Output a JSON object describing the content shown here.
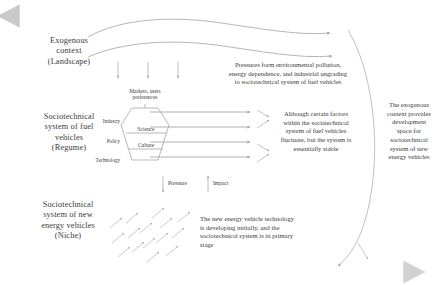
{
  "figure": {
    "type": "multi-level-perspective-diagram",
    "background": "#ffffff",
    "stroke_color": "#8d8d8d",
    "text_color": "#3b3b3b",
    "axis_gradient_dark": "#5f5f5f",
    "axis_gradient_light": "#d9d9d9"
  },
  "levels": [
    {
      "id": "landscape",
      "label": "Exogenous\ncontext\n(Landscape)"
    },
    {
      "id": "regime",
      "label": "Sociotechnical\nsystem of fuel\nvehicles\n(Regume)"
    },
    {
      "id": "niche",
      "label": "Sociotechnical\nsystem of new\nenergy vehicles\n(Niche)"
    }
  ],
  "notes": {
    "landscape_pressure": "Pressures form environmental pollution,\nenergy dependence, and industrial ungrading\nto sociotechnical system of fuel vehicles",
    "regime_stability": "Although certain factors\nwithin the sociatechnical\nsystem of fuel vehicles\nfluctuate, but the system is\nessentially stable",
    "niche_development": "The new energy vehicle technology\nis developing initially, and the\nsociotechnical system is in primary\nstage",
    "exogenous_space": "The exogenous\ncontext provides\ndevelopment\nspace for\nsociotechnical\nsystem of new\nenergy vehicles"
  },
  "regime_hexagon": {
    "top_label": "Markets, users\npreferences",
    "side_labels": [
      "Industry",
      "Policy",
      "Technology"
    ],
    "inner_labels": [
      "Science",
      "Culture"
    ]
  },
  "flow_labels": {
    "pressure": "Pressure",
    "impact": "Impact"
  },
  "axes": {
    "vertical": {
      "name": "level-axis",
      "direction": "up"
    },
    "horizontal": {
      "name": "time-axis",
      "direction": "right"
    }
  }
}
